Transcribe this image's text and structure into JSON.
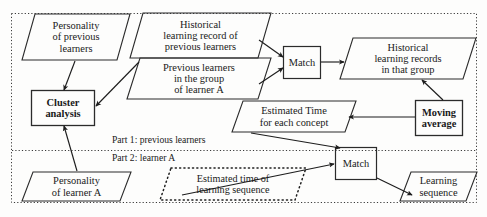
{
  "diagram": {
    "outer_border_style": "dotted",
    "divider_style": "dotted",
    "part_labels": [
      {
        "id": "part1",
        "text": "Part 1: previous learners"
      },
      {
        "id": "part2",
        "text": "Part 2: learner A"
      }
    ],
    "nodes": [
      {
        "id": "personality-previous",
        "shape": "parallelogram",
        "text": "Personality\nof previous\nlearners",
        "x": 22,
        "y": 14,
        "w": 108,
        "h": 46,
        "skew": 13,
        "bold": false,
        "border": "solid"
      },
      {
        "id": "historical-record-previous",
        "shape": "parallelogram",
        "text": "Historical\nlearning record of\nprevious learners",
        "x": 130,
        "y": 13,
        "w": 141,
        "h": 45,
        "skew": 13,
        "bold": false,
        "border": "solid"
      },
      {
        "id": "previous-learners-group",
        "shape": "parallelogram",
        "text": "Previous learners\nin the group\nof learner A",
        "x": 127,
        "y": 58,
        "w": 144,
        "h": 41,
        "skew": 13,
        "bold": false,
        "border": "solid"
      },
      {
        "id": "cluster-analysis",
        "shape": "rect",
        "text": "Cluster\nanalysis",
        "x": 31,
        "y": 90,
        "w": 64,
        "h": 36,
        "bold": true,
        "border": "solid"
      },
      {
        "id": "match-1",
        "shape": "rect",
        "text": "Match",
        "x": 283,
        "y": 46,
        "w": 38,
        "h": 33,
        "bold": false,
        "border": "solid"
      },
      {
        "id": "historical-records-group",
        "shape": "parallelogram",
        "text": "Historical\nlearning records\nin that group",
        "x": 340,
        "y": 38,
        "w": 136,
        "h": 41,
        "skew": 13,
        "bold": false,
        "border": "solid"
      },
      {
        "id": "estimated-time-concept",
        "shape": "parallelogram",
        "text": "Estimated Time\nfor each concept",
        "x": 232,
        "y": 101,
        "w": 124,
        "h": 31,
        "skew": 11,
        "bold": false,
        "border": "solid"
      },
      {
        "id": "moving-average",
        "shape": "rect",
        "text": "Moving\naverage",
        "x": 415,
        "y": 100,
        "w": 48,
        "h": 36,
        "bold": true,
        "border": "solid"
      },
      {
        "id": "personality-learner-a",
        "shape": "parallelogram",
        "text": "Personality\nof learner A",
        "x": 22,
        "y": 172,
        "w": 109,
        "h": 29,
        "skew": 11,
        "bold": false,
        "border": "solid"
      },
      {
        "id": "estimated-time-sequence",
        "shape": "parallelogram",
        "text": "Estimated time of\nlearning sequence",
        "x": 160,
        "y": 168,
        "w": 146,
        "h": 32,
        "skew": 11,
        "bold": false,
        "border": "dotted"
      },
      {
        "id": "match-2",
        "shape": "rect",
        "text": "Match",
        "x": 335,
        "y": 147,
        "w": 42,
        "h": 33,
        "bold": false,
        "border": "solid"
      },
      {
        "id": "learning-sequence",
        "shape": "parallelogram",
        "text": "Learning\nsequence",
        "x": 400,
        "y": 172,
        "w": 77,
        "h": 29,
        "skew": 11,
        "bold": false,
        "border": "solid"
      }
    ],
    "edges": [
      {
        "id": "e1",
        "from": "personality-previous",
        "to": "cluster-analysis"
      },
      {
        "id": "e2",
        "from": "previous-learners-group",
        "to": "cluster-analysis"
      },
      {
        "id": "e3",
        "from": "historical-record-previous",
        "to": "match-1"
      },
      {
        "id": "e4",
        "from": "previous-learners-group",
        "to": "match-1"
      },
      {
        "id": "e5",
        "from": "match-1",
        "to": "historical-records-group"
      },
      {
        "id": "e6",
        "from": "historical-records-group",
        "to": "moving-average"
      },
      {
        "id": "e7",
        "from": "moving-average",
        "to": "estimated-time-concept"
      },
      {
        "id": "e8",
        "from": "estimated-time-concept",
        "to": "match-2"
      },
      {
        "id": "e9",
        "from": "personality-learner-a",
        "to": "cluster-analysis"
      },
      {
        "id": "e10",
        "from": "estimated-time-sequence",
        "to": "match-2"
      },
      {
        "id": "e11",
        "from": "match-2",
        "to": "learning-sequence"
      }
    ],
    "colors": {
      "stroke": "#2b2b2b",
      "text": "#1a1a1a",
      "background": "#fdfdfc"
    }
  }
}
